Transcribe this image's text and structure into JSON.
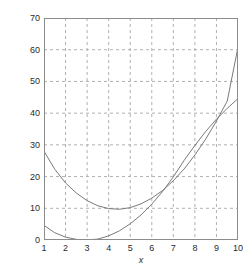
{
  "chart_data": {
    "type": "line",
    "title": "",
    "xlabel": "x",
    "ylabel": "",
    "xlim": [
      1,
      10
    ],
    "ylim": [
      0,
      70
    ],
    "xticks": [
      1,
      2,
      3,
      4,
      5,
      6,
      7,
      8,
      9,
      10
    ],
    "yticks": [
      0,
      10,
      20,
      30,
      40,
      50,
      60,
      70
    ],
    "grid": true,
    "grid_style": "dashed",
    "grid_color": "#b0b0b0",
    "legend": null,
    "axis_color": "#808080",
    "line_color": "#7a7a7a",
    "series": [
      {
        "name": "curve-1",
        "x": [
          1,
          1.5,
          2,
          2.5,
          3,
          3.5,
          4,
          4.5,
          5,
          5.5,
          6,
          6.5,
          7,
          7.5,
          8,
          8.5,
          9,
          9.5,
          10
        ],
        "values": [
          28.0,
          22.3,
          18.0,
          14.8,
          12.4,
          10.8,
          9.9,
          9.7,
          10.2,
          11.4,
          13.2,
          15.6,
          18.7,
          22.4,
          26.8,
          31.8,
          37.5,
          43.8,
          60.8
        ]
      },
      {
        "name": "curve-2",
        "x": [
          1,
          1.5,
          2,
          2.5,
          3,
          3.5,
          4,
          4.5,
          5,
          5.5,
          6,
          6.5,
          7,
          7.5,
          8,
          8.5,
          9,
          9.5,
          10
        ],
        "values": [
          4.6,
          2.3,
          0.9,
          0.2,
          0.0,
          0.3,
          1.3,
          2.9,
          5.1,
          7.9,
          11.3,
          15.3,
          19.9,
          25.1,
          29.8,
          34.2,
          38.1,
          41.5,
          44.6
        ]
      }
    ]
  },
  "axes": {
    "ytick_labels": [
      "70",
      "60",
      "50",
      "40",
      "30",
      "20",
      "10",
      "0"
    ],
    "xtick_labels": [
      "1",
      "2",
      "3",
      "4",
      "5",
      "6",
      "7",
      "8",
      "9",
      "10"
    ],
    "xlabel_text": "x"
  }
}
